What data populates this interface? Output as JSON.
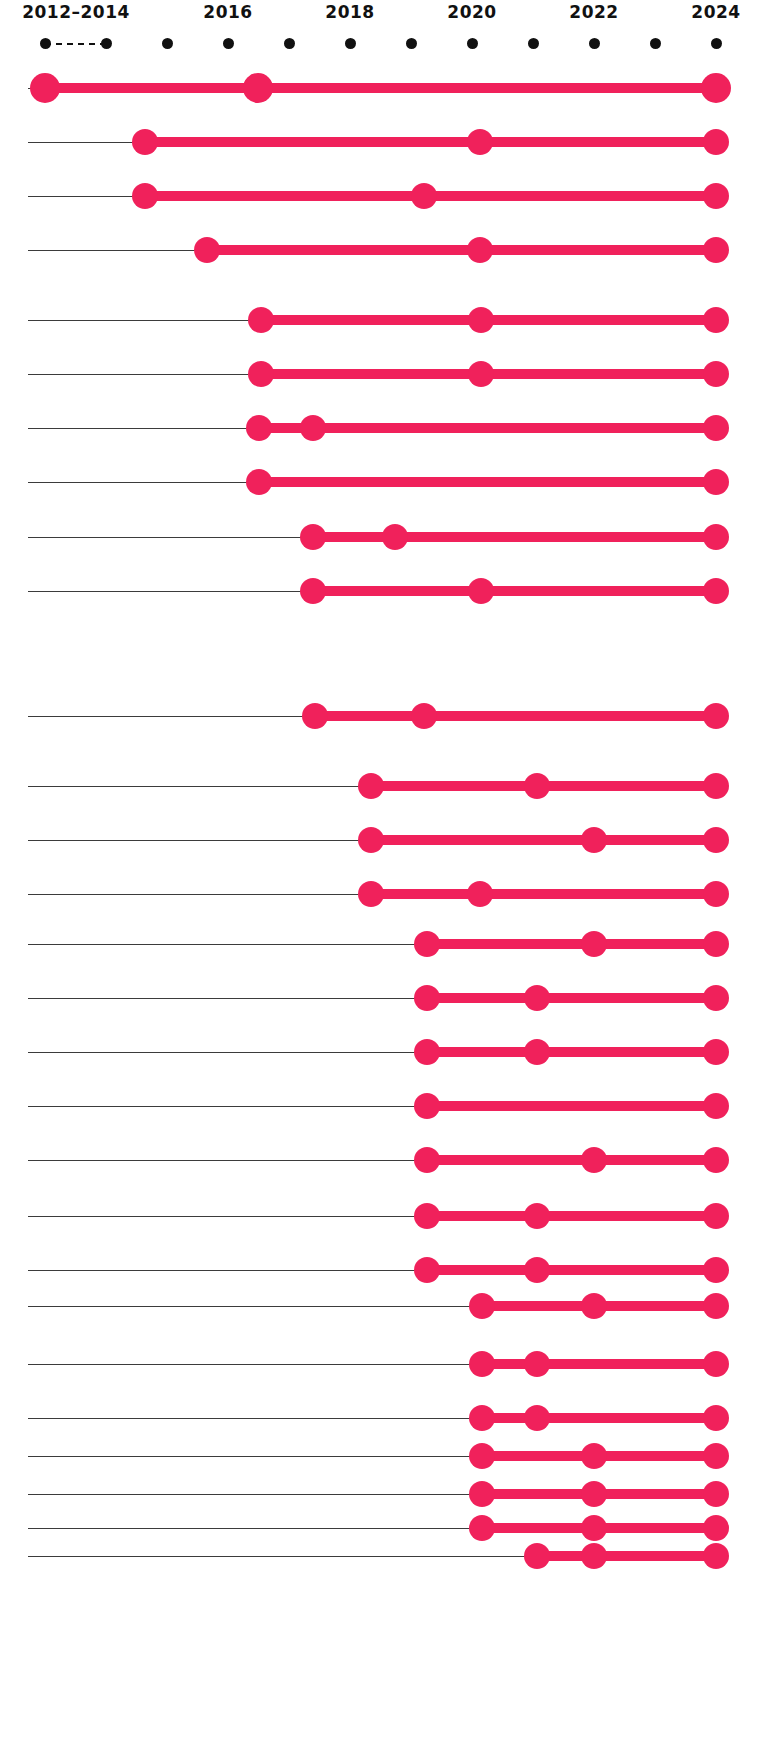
{
  "chart_data": {
    "type": "timeline",
    "title": "",
    "subtitle": "",
    "xlabel": "",
    "ylabel": "",
    "grid": false,
    "legend": null,
    "accent_color": "#F0215B",
    "baseline_color": "#3b3b3b",
    "tick_color": "#111111",
    "background": "#ffffff",
    "axis": {
      "labels": [
        {
          "text": "2012–2014",
          "x": 76
        },
        {
          "text": "2016",
          "x": 228
        },
        {
          "text": "2018",
          "x": 350
        },
        {
          "text": "2020",
          "x": 472
        },
        {
          "text": "2022",
          "x": 594
        },
        {
          "text": "2024",
          "x": 716
        }
      ],
      "ticks": [
        {
          "year": "2012",
          "x": 45
        },
        {
          "year": "2014",
          "x": 106
        },
        {
          "year": "2015",
          "x": 167
        },
        {
          "year": "2016",
          "x": 228
        },
        {
          "year": "2017",
          "x": 289
        },
        {
          "year": "2018",
          "x": 350
        },
        {
          "year": "2019",
          "x": 411
        },
        {
          "year": "2020",
          "x": 472
        },
        {
          "year": "2021",
          "x": 533
        },
        {
          "year": "2022",
          "x": 594
        },
        {
          "year": "2023",
          "x": 655
        },
        {
          "year": "2024",
          "x": 716
        }
      ],
      "dash_segment": {
        "from_x": 45,
        "to_x": 106
      }
    },
    "x_min": 28,
    "x_max": 716,
    "row_height": 34,
    "rows": [
      {
        "index": 0,
        "y": 72,
        "points": [
          45,
          258,
          716
        ],
        "big": true
      },
      {
        "index": 1,
        "y": 126,
        "points": [
          145,
          480,
          716
        ],
        "big": false
      },
      {
        "index": 2,
        "y": 180,
        "points": [
          145,
          424,
          716
        ],
        "big": false
      },
      {
        "index": 3,
        "y": 234,
        "points": [
          207,
          480,
          716
        ],
        "big": false
      },
      {
        "index": 4,
        "y": 304,
        "points": [
          261,
          481,
          716
        ],
        "big": false
      },
      {
        "index": 5,
        "y": 358,
        "points": [
          261,
          481,
          716
        ],
        "big": false
      },
      {
        "index": 6,
        "y": 412,
        "points": [
          259,
          313,
          716
        ],
        "big": false
      },
      {
        "index": 7,
        "y": 466,
        "points": [
          259,
          716
        ],
        "big": false
      },
      {
        "index": 8,
        "y": 521,
        "points": [
          313,
          395,
          716
        ],
        "big": false
      },
      {
        "index": 9,
        "y": 575,
        "points": [
          313,
          481,
          716
        ],
        "big": false
      },
      {
        "index": 10,
        "y": 700,
        "points": [
          315,
          424,
          716
        ],
        "big": false
      },
      {
        "index": 11,
        "y": 770,
        "points": [
          371,
          537,
          716
        ],
        "big": false
      },
      {
        "index": 12,
        "y": 824,
        "points": [
          371,
          594,
          716
        ],
        "big": false
      },
      {
        "index": 13,
        "y": 878,
        "points": [
          371,
          480,
          716
        ],
        "big": false
      },
      {
        "index": 14,
        "y": 928,
        "points": [
          427,
          594,
          716
        ],
        "big": false
      },
      {
        "index": 15,
        "y": 982,
        "points": [
          427,
          537,
          716
        ],
        "big": false
      },
      {
        "index": 16,
        "y": 1036,
        "points": [
          427,
          537,
          716
        ],
        "big": false
      },
      {
        "index": 17,
        "y": 1090,
        "points": [
          427,
          716
        ],
        "big": false
      },
      {
        "index": 18,
        "y": 1144,
        "points": [
          427,
          594,
          716
        ],
        "big": false
      },
      {
        "index": 19,
        "y": 1200,
        "points": [
          427,
          537,
          716
        ],
        "big": false
      },
      {
        "index": 20,
        "y": 1254,
        "points": [
          427,
          537,
          716
        ],
        "big": false
      },
      {
        "index": 21,
        "y": 1290,
        "points": [
          482,
          594,
          716
        ],
        "big": false
      },
      {
        "index": 22,
        "y": 1348,
        "points": [
          482,
          537,
          716
        ],
        "big": false
      },
      {
        "index": 23,
        "y": 1402,
        "points": [
          482,
          537,
          716
        ],
        "big": false
      },
      {
        "index": 24,
        "y": 1440,
        "points": [
          482,
          594,
          716
        ],
        "big": false
      },
      {
        "index": 25,
        "y": 1478,
        "points": [
          482,
          594,
          716
        ],
        "big": false
      },
      {
        "index": 26,
        "y": 1512,
        "points": [
          482,
          594,
          716
        ],
        "big": false
      },
      {
        "index": 27,
        "y": 1540,
        "points": [
          537,
          594,
          716
        ],
        "big": false
      }
    ]
  }
}
